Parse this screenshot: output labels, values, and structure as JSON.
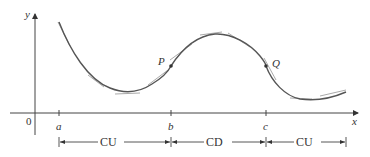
{
  "figure": {
    "axes": {
      "x_label": "x",
      "y_label": "y",
      "origin_label": "0"
    },
    "ticks": [
      {
        "label": "a",
        "x": 59
      },
      {
        "label": "b",
        "x": 171
      },
      {
        "label": "c",
        "x": 266
      }
    ],
    "points": [
      {
        "label": "P",
        "description": "inflection point at b"
      },
      {
        "label": "Q",
        "description": "inflection point at c"
      }
    ],
    "intervals": [
      {
        "label": "CU",
        "meaning": "concave upward",
        "from": "a",
        "to": "b"
      },
      {
        "label": "CD",
        "meaning": "concave downward",
        "from": "b",
        "to": "c"
      },
      {
        "label": "CU",
        "meaning": "concave upward",
        "from": "c",
        "to": "end"
      }
    ],
    "colors": {
      "curve": "#555555",
      "tangent": "#999999",
      "axis": "#444444"
    }
  }
}
